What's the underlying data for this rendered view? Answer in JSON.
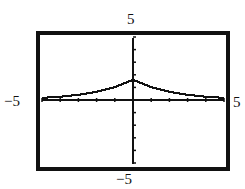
{
  "chart_data": {
    "type": "line",
    "title": "",
    "xlabel": "",
    "ylabel": "",
    "xlim": [
      -5,
      5
    ],
    "ylim": [
      -5,
      5
    ],
    "xtick_step": 1,
    "ytick_step": 1,
    "grid": false,
    "legend": null,
    "window_labels": {
      "xmin": "−5",
      "xmax": "5",
      "ymin": "−5",
      "ymax": "5"
    },
    "series": [
      {
        "name": "f(x)",
        "style": "stepped-pixel curve, symmetric about y-axis, cusp at x=0",
        "x": [
          -5,
          -4,
          -3,
          -2,
          -1,
          0,
          1,
          2,
          3,
          4,
          5
        ],
        "y": [
          0.17,
          0.26,
          0.41,
          0.65,
          1.02,
          1.6,
          1.02,
          0.65,
          0.41,
          0.26,
          0.17
        ]
      }
    ]
  },
  "colors": {
    "axis": "#111111",
    "frame": "#111111",
    "curve": "#111111",
    "background": "#ffffff"
  }
}
